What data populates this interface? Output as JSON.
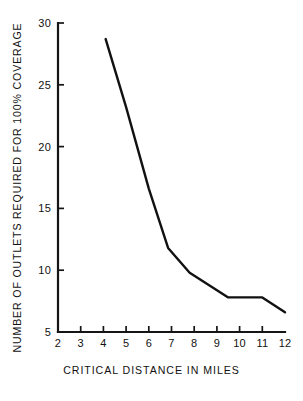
{
  "chart_data": {
    "type": "line",
    "title": "",
    "xlabel": "CRITICAL DISTANCE IN MILES",
    "ylabel": "NUMBER OF OUTLETS REQUIRED FOR 100% COVERAGE",
    "xlim": [
      2,
      12
    ],
    "ylim": [
      5,
      30
    ],
    "xticks": [
      2,
      3,
      4,
      5,
      6,
      7,
      8,
      9,
      10,
      11,
      12
    ],
    "xtick_labels": [
      "2",
      "3",
      "4",
      "5",
      "6",
      "7",
      "8",
      "9",
      "10",
      "11",
      "12"
    ],
    "yticks": [
      5,
      10,
      15,
      20,
      25,
      30
    ],
    "ytick_labels": [
      "5",
      "10",
      "15",
      "20",
      "25",
      "30"
    ],
    "grid": false,
    "legend": false,
    "series": [
      {
        "name": "outlets required",
        "x": [
          4.1,
          5.0,
          6.0,
          6.85,
          7.8,
          9.5,
          11.0,
          12.0
        ],
        "y": [
          28.7,
          23.2,
          16.6,
          11.8,
          9.8,
          7.8,
          7.8,
          6.6
        ]
      }
    ]
  },
  "figure": {
    "background_color": "#ffffff",
    "line_color": "#111111",
    "axis_color": "#151515"
  }
}
